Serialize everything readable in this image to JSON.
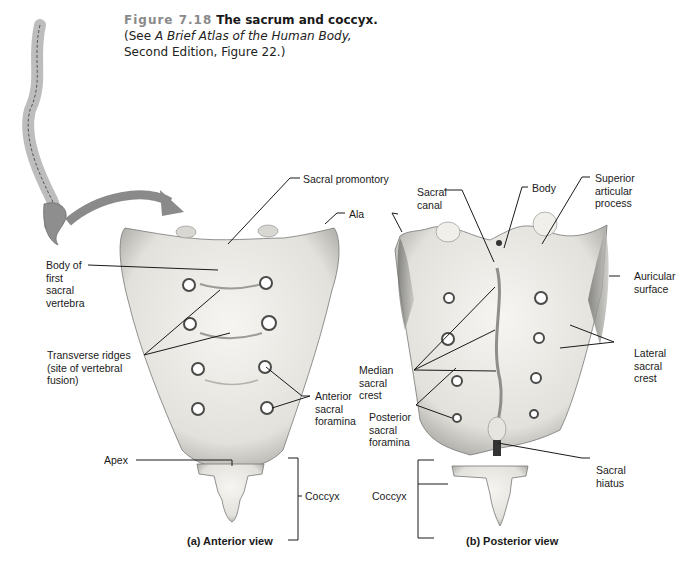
{
  "caption": {
    "figure_number": "Figure 7.18",
    "title": "The sacrum and coccyx.",
    "see_prefix": "(See ",
    "atlas_title": "A Brief Atlas of the Human Body,",
    "see_suffix": "Second Edition, Figure 22.)"
  },
  "anterior": {
    "view_label": "(a) Anterior view",
    "labels": {
      "sacral_promontory": "Sacral promontory",
      "ala": "Ala",
      "body_first_vertebra": "Body of\nfirst\nsacral\nvertebra",
      "transverse_ridges": "Transverse ridges\n(site of vertebral\nfusion)",
      "anterior_foramina": "Anterior\nsacral\nforamina",
      "apex": "Apex",
      "coccyx": "Coccyx"
    }
  },
  "posterior": {
    "view_label": "(b) Posterior view",
    "labels": {
      "sacral_canal": "Sacral\ncanal",
      "body": "Body",
      "superior_articular": "Superior\narticular\nprocess",
      "auricular_surface": "Auricular\nsurface",
      "median_crest": "Median\nsacral\ncrest",
      "lateral_crest": "Lateral\nsacral\ncrest",
      "posterior_foramina": "Posterior\nsacral\nforamina",
      "sacral_hiatus": "Sacral\nhiatus",
      "coccyx": "Coccyx"
    }
  },
  "colors": {
    "bone": "#ecebe6",
    "bone_shade": "#b9b8b2",
    "spine_highlight": "#8e8e8e",
    "arrow": "#8a8a8a",
    "leader": "#1a1a1a"
  }
}
